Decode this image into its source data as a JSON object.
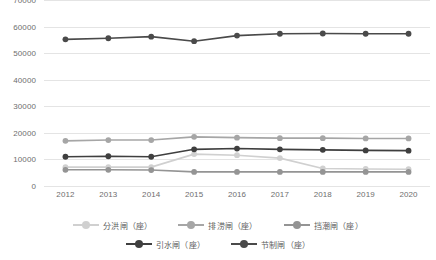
{
  "chart_data": {
    "type": "line",
    "title": "",
    "xlabel": "",
    "ylabel": "",
    "categories": [
      "2012",
      "2013",
      "2014",
      "2015",
      "2016",
      "2017",
      "2018",
      "2019",
      "2020"
    ],
    "ylim": [
      0,
      70000
    ],
    "ytick_values": [
      70000,
      60000,
      50000,
      40000,
      30000,
      20000,
      10000,
      0
    ],
    "ytick_labels": [
      "70000",
      "60000",
      "50000",
      "40000",
      "30000",
      "20000",
      "10000",
      "0"
    ],
    "grid": true,
    "legend_position": "bottom",
    "series": [
      {
        "name": "分洪闸（座）",
        "color": "#d0d0d0",
        "values": [
          7100,
          7100,
          7100,
          12000,
          11600,
          10500,
          6600,
          6400,
          6300
        ]
      },
      {
        "name": "排涝闸（座）",
        "color": "#a6a6a6",
        "values": [
          17000,
          17300,
          17300,
          18500,
          18200,
          18000,
          18000,
          17900,
          17900
        ]
      },
      {
        "name": "挡潮闸（座）",
        "color": "#949494",
        "values": [
          6100,
          6100,
          6000,
          5300,
          5300,
          5300,
          5300,
          5300,
          5300
        ]
      },
      {
        "name": "引水闸（座）",
        "color": "#3f3f3f",
        "values": [
          11000,
          11200,
          11000,
          13800,
          14100,
          13800,
          13600,
          13400,
          13300
        ]
      },
      {
        "name": "节制闸（座）",
        "color": "#4a4a4a",
        "values": [
          55200,
          55600,
          56200,
          54500,
          56600,
          57300,
          57400,
          57300,
          57300
        ]
      }
    ]
  },
  "legend": {
    "items": [
      {
        "label": "分洪闸（座）"
      },
      {
        "label": "排涝闸（座）"
      },
      {
        "label": "挡潮闸（座）"
      },
      {
        "label": "引水闸（座）"
      },
      {
        "label": "节制闸（座）"
      }
    ]
  }
}
